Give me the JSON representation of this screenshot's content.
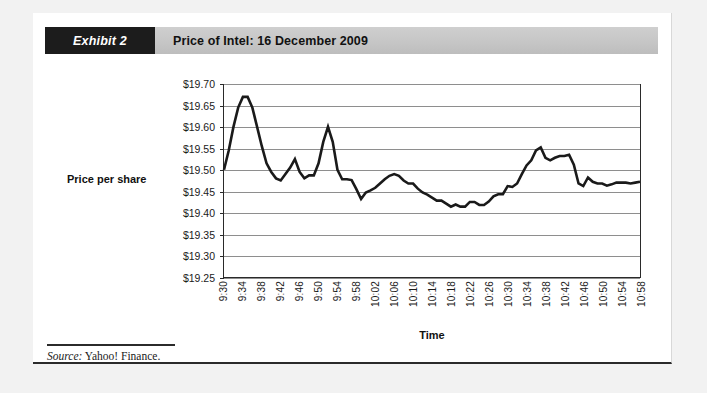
{
  "exhibit": {
    "tag": "Exhibit 2",
    "title": "Price of Intel: 16 December 2009"
  },
  "source": {
    "label": "Source:",
    "text": " Yahoo! Finance."
  },
  "colors": {
    "tag_background": "#1c1c1c",
    "title_bar": "#c6c6c6",
    "page_background": "#f2f2f2",
    "card_background": "#ffffff",
    "series_line": "#1a1a1a",
    "gridline": "#8e8e8e",
    "axis": "#2a2a2a"
  },
  "chart_data": {
    "type": "line",
    "title": "Price of Intel: 16 December 2009",
    "xlabel": "Time",
    "ylabel": "Price per share",
    "ylim": [
      19.25,
      19.7
    ],
    "ytick_step": 0.05,
    "ytick_labels": [
      "$19.70",
      "$19.65",
      "$19.60",
      "$19.55",
      "$19.50",
      "$19.45",
      "$19.40",
      "$19.35",
      "$19.30",
      "$19.25"
    ],
    "ytick_values": [
      19.7,
      19.65,
      19.6,
      19.55,
      19.5,
      19.45,
      19.4,
      19.35,
      19.3,
      19.25
    ],
    "xtick_labels": [
      "9:30",
      "9:34",
      "9:38",
      "9:42",
      "9:46",
      "9:50",
      "9:54",
      "9:58",
      "10:02",
      "10:06",
      "10:10",
      "10:14",
      "10:18",
      "10:22",
      "10:26",
      "10:30",
      "10:34",
      "10:38",
      "10:42",
      "10:46",
      "10:50",
      "10:54",
      "10:58"
    ],
    "xtick_interval_minutes": 4,
    "x_start": "9:30",
    "x_end": "10:58",
    "sample_interval_minutes": 1,
    "grid": "horizontal",
    "legend": "none",
    "series": [
      {
        "name": "Intel price per share",
        "x": [
          "9:30",
          "9:31",
          "9:32",
          "9:33",
          "9:34",
          "9:35",
          "9:36",
          "9:37",
          "9:38",
          "9:39",
          "9:40",
          "9:41",
          "9:42",
          "9:43",
          "9:44",
          "9:45",
          "9:46",
          "9:47",
          "9:48",
          "9:49",
          "9:50",
          "9:51",
          "9:52",
          "9:53",
          "9:54",
          "9:55",
          "9:56",
          "9:57",
          "9:58",
          "9:59",
          "10:00",
          "10:01",
          "10:02",
          "10:03",
          "10:04",
          "10:05",
          "10:06",
          "10:07",
          "10:08",
          "10:09",
          "10:10",
          "10:11",
          "10:12",
          "10:13",
          "10:14",
          "10:15",
          "10:16",
          "10:17",
          "10:18",
          "10:19",
          "10:20",
          "10:21",
          "10:22",
          "10:23",
          "10:24",
          "10:25",
          "10:26",
          "10:27",
          "10:28",
          "10:29",
          "10:30",
          "10:31",
          "10:32",
          "10:33",
          "10:34",
          "10:35",
          "10:36",
          "10:37",
          "10:38",
          "10:39",
          "10:40",
          "10:41",
          "10:42",
          "10:43",
          "10:44",
          "10:45",
          "10:46",
          "10:47",
          "10:48",
          "10:49",
          "10:50",
          "10:51",
          "10:52",
          "10:53",
          "10:54",
          "10:55",
          "10:56",
          "10:57",
          "10:58"
        ],
        "values": [
          19.5,
          19.545,
          19.6,
          19.645,
          19.67,
          19.67,
          19.645,
          19.6,
          19.555,
          19.515,
          19.495,
          19.48,
          19.475,
          19.49,
          19.505,
          19.525,
          19.495,
          19.48,
          19.487,
          19.487,
          19.515,
          19.565,
          19.6,
          19.565,
          19.5,
          19.478,
          19.478,
          19.476,
          19.455,
          19.432,
          19.447,
          19.452,
          19.458,
          19.468,
          19.478,
          19.486,
          19.49,
          19.486,
          19.475,
          19.468,
          19.468,
          19.456,
          19.447,
          19.442,
          19.435,
          19.428,
          19.428,
          19.421,
          19.414,
          19.419,
          19.414,
          19.414,
          19.425,
          19.425,
          19.418,
          19.418,
          19.426,
          19.438,
          19.443,
          19.443,
          19.462,
          19.46,
          19.468,
          19.49,
          19.51,
          19.522,
          19.545,
          19.552,
          19.528,
          19.522,
          19.528,
          19.532,
          19.532,
          19.535,
          19.512,
          19.468,
          19.462,
          19.482,
          19.472,
          19.468,
          19.468,
          19.463,
          19.466,
          19.47,
          19.47,
          19.47,
          19.468,
          19.47,
          19.472
        ]
      }
    ]
  }
}
